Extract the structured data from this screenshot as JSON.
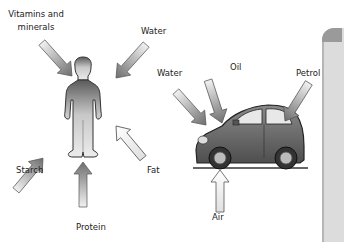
{
  "human": {
    "inputs": [
      {
        "label": "Vitamins and minerals",
        "line1": "Vitamins and",
        "line2": "minerals",
        "direction": "from-top-left"
      },
      {
        "label": "Water",
        "direction": "from-top-right"
      },
      {
        "label": "Starch",
        "direction": "from-bottom-left"
      },
      {
        "label": "Fat",
        "direction": "from-bottom-right"
      },
      {
        "label": "Protein",
        "direction": "from-below"
      }
    ]
  },
  "car": {
    "inputs": [
      {
        "label": "Water",
        "direction": "from-top-left"
      },
      {
        "label": "Oil",
        "direction": "from-above"
      },
      {
        "label": "Petrol",
        "direction": "from-top-right"
      },
      {
        "label": "Air",
        "direction": "from-below"
      }
    ]
  },
  "colors": {
    "arrow_dark": "#707070",
    "arrow_light": "#f2f2f2",
    "figure_dark": "#5a5a5a",
    "figure_light": "#e6e6e6",
    "car_body": "#6e6e6e",
    "panel": "#dcdcdc"
  }
}
